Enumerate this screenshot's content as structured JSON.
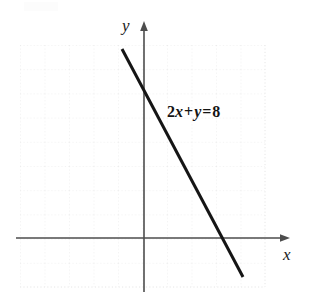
{
  "figure": {
    "width": 313,
    "height": 301,
    "background": "#ffffff"
  },
  "labels": {
    "y_axis": "y",
    "x_axis": "x",
    "equation_coefficient": "2",
    "equation_var_x": "x",
    "equation_plus": "+",
    "equation_var_y": "y",
    "equation_equals": "=",
    "equation_constant": "8",
    "equation_full": "2x + y = 8"
  },
  "colors": {
    "line": "#151515",
    "axis": "#4a4a4a",
    "grid": "#e8e8e8",
    "text": "#141414",
    "background": "#ffffff"
  },
  "chart_data": {
    "type": "line",
    "title": "",
    "xlabel": "x",
    "ylabel": "y",
    "annotations": [
      {
        "text": "2x + y = 8",
        "x": 1.0,
        "y": 5.1
      }
    ],
    "grid": true,
    "grid_spacing": 1,
    "legend": "none",
    "xlim": [
      -5.2,
      6.0
    ],
    "ylim": [
      -2.0,
      8.0
    ],
    "series": [
      {
        "name": "2x + y = 8",
        "equation": "2x + y = 8",
        "slope": -2,
        "y_intercept": 8,
        "x_intercept": 4,
        "points": [
          {
            "x": -0.9,
            "y": 9.8
          },
          {
            "x": 0,
            "y": 8
          },
          {
            "x": 4,
            "y": 0
          },
          {
            "x": 4.8,
            "y": -1.6
          }
        ]
      }
    ]
  },
  "geometry": {
    "origin_px": {
      "x": 144,
      "y": 238
    },
    "unit_px": 24,
    "grid_bounds_px": {
      "left": 20,
      "top": 45,
      "right": 265,
      "bottom": 287
    },
    "line_start_px": {
      "x": 122,
      "y": 49
    },
    "line_end_px": {
      "x": 243,
      "y": 277
    },
    "x_axis_end_px": {
      "x": 290,
      "y": 238
    },
    "y_axis_end_px": {
      "x": 144,
      "y": 21
    }
  }
}
